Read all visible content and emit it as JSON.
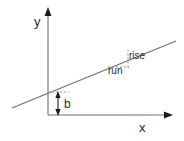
{
  "figure": {
    "background_color": "#ffffff",
    "stroke_color": "#6e6e6e",
    "dash_color": "#8a8a8a",
    "text_color": "#2b2b2b",
    "arrow_color": "#1a1a1a"
  },
  "axes": {
    "y_label": "y",
    "x_label": "x",
    "origin": {
      "x": 48,
      "y": 115
    },
    "y_axis": {
      "x": 48,
      "y_top": 10,
      "y_bottom": 115,
      "arrow": "up"
    },
    "x_axis": {
      "y": 115,
      "x_left": 48,
      "x_right": 172,
      "arrow": "right"
    }
  },
  "line": {
    "name": "sloped-line",
    "x1": 12,
    "y1": 108,
    "x2": 176,
    "y2": 41,
    "y_intercept_point": {
      "x": 48,
      "y": 92
    }
  },
  "annotations": {
    "intercept": {
      "label": "b",
      "arrow_x": 58,
      "arrow_y_top": 93,
      "arrow_y_bottom": 115,
      "double_headed": true,
      "guide_dash": {
        "x1": 48,
        "x2": 68,
        "y": 92
      }
    },
    "slope_triangle": {
      "rise_label": "rise",
      "run_label": "run",
      "run_dash": {
        "x1": 109,
        "y1": 67,
        "x2": 128,
        "y2": 67
      },
      "rise_dash": {
        "x1": 128,
        "y1": 67,
        "x2": 128,
        "y2": 51
      },
      "hypotenuse_on_line": true
    }
  }
}
